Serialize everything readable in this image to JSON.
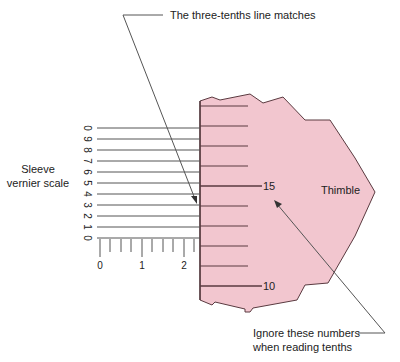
{
  "diagram": {
    "type": "micrometer-vernier-reading",
    "colors": {
      "thimble_fill": "#f2c6cf",
      "thimble_stroke": "#5a3a40",
      "line": "#444444",
      "text": "#222222",
      "background": "#ffffff"
    },
    "annotations": {
      "top_callout": "The three-tenths line matches",
      "bottom_callout_line1": "Ignore these numbers",
      "bottom_callout_line2": "when reading tenths"
    },
    "sleeve": {
      "label_line1": "Sleeve",
      "label_line2": "vernier scale",
      "vernier_numbers": [
        "0",
        "9",
        "8",
        "7",
        "6",
        "5",
        "4",
        "3",
        "2",
        "1",
        "0"
      ],
      "main_scale_numbers": [
        "0",
        "1",
        "2"
      ]
    },
    "thimble": {
      "label": "Thimble",
      "numbers": [
        "15",
        "10"
      ]
    }
  }
}
